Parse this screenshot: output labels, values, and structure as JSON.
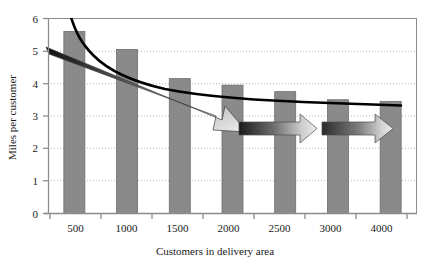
{
  "chart_data": {
    "type": "bar",
    "title": "",
    "xlabel": "Customers in delivery area",
    "ylabel": "Miles per customer",
    "categories": [
      "500",
      "1000",
      "1500",
      "2000",
      "2500",
      "3000",
      "4000"
    ],
    "values": [
      5.6,
      5.05,
      4.15,
      3.95,
      3.75,
      3.5,
      3.45
    ],
    "series": [
      {
        "name": "Miles per customer",
        "type": "bar",
        "values": [
          5.6,
          5.05,
          4.15,
          3.95,
          3.75,
          3.5,
          3.45
        ],
        "color": "#8a8a8a"
      },
      {
        "name": "Fitted decline curve",
        "type": "line",
        "color": "#000000",
        "x": [
          "500",
          "1000",
          "1500",
          "2000",
          "2500",
          "3000",
          "4000"
        ],
        "values": [
          6.4,
          5.05,
          4.55,
          4.25,
          4.05,
          3.95,
          3.85
        ]
      }
    ],
    "ylim": [
      0,
      6
    ],
    "yticks": [
      0,
      1,
      2,
      3,
      4,
      5,
      6
    ],
    "ytick_labels": [
      "0",
      "1",
      "2",
      "3",
      "4",
      "5",
      "6"
    ],
    "xtick_labels": [
      "500",
      "1000",
      "1500",
      "2000",
      "2500",
      "3000",
      "4000"
    ],
    "grid": "horizontal-dotted",
    "legend": "none",
    "annotations": [
      {
        "name": "steep-decline-arrow",
        "kind": "arrow",
        "direction": "down-right",
        "from_value": 5.0,
        "to_value": 2.7,
        "from_category": "500",
        "to_category": "2000",
        "fill": "dark-to-light-gradient"
      },
      {
        "name": "leveling-arrow-1",
        "kind": "arrow",
        "direction": "right",
        "at_value": 2.7,
        "from_category": "2000",
        "to_category": "2500",
        "fill": "dark-to-light-gradient"
      },
      {
        "name": "leveling-arrow-2",
        "kind": "arrow",
        "direction": "right",
        "at_value": 2.7,
        "from_category": "3000",
        "to_category": "4000",
        "fill": "dark-to-light-gradient"
      }
    ],
    "colors": {
      "bar": "#8a8a8a",
      "bar_stroke": "#6e6e6e",
      "curve": "#000000",
      "grid": "#b9b9b9",
      "axis": "#8c8c8c",
      "text": "#1a1a1a",
      "arrow_dark": "#1c1c1c",
      "arrow_light": "#e8e8e8"
    }
  }
}
